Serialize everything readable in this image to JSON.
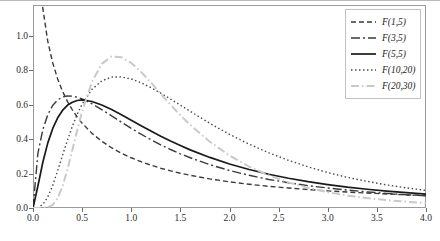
{
  "chart_data": {
    "type": "line",
    "title": "",
    "xlabel": "",
    "ylabel": "",
    "xlim": [
      0.0,
      4.0
    ],
    "ylim": [
      0.0,
      1.18
    ],
    "grid": false,
    "legend_position": "top-right",
    "xticks": [
      "0.0",
      "0.5",
      "1.0",
      "1.5",
      "2.0",
      "2.5",
      "3.0",
      "3.5",
      "4.0"
    ],
    "xtick_values": [
      0.0,
      0.5,
      1.0,
      1.5,
      2.0,
      2.5,
      3.0,
      3.5,
      4.0
    ],
    "yticks": [
      "0.0",
      "0.2",
      "0.4",
      "0.6",
      "0.8",
      "1.0"
    ],
    "ytick_values": [
      0.0,
      0.2,
      0.4,
      0.6,
      0.8,
      1.0
    ],
    "x": [
      0.0,
      0.05,
      0.1,
      0.15,
      0.2,
      0.25,
      0.3,
      0.35,
      0.4,
      0.45,
      0.5,
      0.6,
      0.7,
      0.8,
      0.9,
      1.0,
      1.1,
      1.2,
      1.3,
      1.4,
      1.5,
      1.6,
      1.8,
      2.0,
      2.2,
      2.4,
      2.6,
      2.8,
      3.0,
      3.2,
      3.4,
      3.6,
      3.8,
      4.0
    ],
    "series": [
      {
        "name": "F(1,5)",
        "label": "F(1,5)",
        "color": "#3a3a3a",
        "dash": "5,3",
        "width": 1.4,
        "values": [
          3.4,
          1.52,
          1.16,
          0.97,
          0.845,
          0.752,
          0.679,
          0.62,
          0.571,
          0.529,
          0.493,
          0.434,
          0.388,
          0.35,
          0.318,
          0.292,
          0.269,
          0.249,
          0.231,
          0.216,
          0.202,
          0.19,
          0.169,
          0.152,
          0.138,
          0.126,
          0.116,
          0.107,
          0.0995,
          0.0928,
          0.0869,
          0.0816,
          0.0769,
          0.0726
        ]
      },
      {
        "name": "F(3,5)",
        "label": "F(3,5)",
        "color": "#3a3a3a",
        "dash": "9,3,2,3",
        "width": 1.4,
        "values": [
          0.0,
          0.318,
          0.455,
          0.542,
          0.596,
          0.628,
          0.645,
          0.651,
          0.65,
          0.644,
          0.634,
          0.606,
          0.572,
          0.536,
          0.499,
          0.463,
          0.429,
          0.397,
          0.367,
          0.34,
          0.315,
          0.292,
          0.252,
          0.218,
          0.19,
          0.166,
          0.147,
          0.13,
          0.116,
          0.104,
          0.0937,
          0.0848,
          0.077,
          0.0703
        ]
      },
      {
        "name": "F(5,5)",
        "label": "F(5,5)",
        "color": "#1a1a1a",
        "dash": "",
        "width": 1.7,
        "values": [
          0.0,
          0.128,
          0.266,
          0.377,
          0.461,
          0.523,
          0.567,
          0.597,
          0.615,
          0.625,
          0.628,
          0.619,
          0.599,
          0.572,
          0.542,
          0.51,
          0.478,
          0.447,
          0.417,
          0.389,
          0.363,
          0.338,
          0.294,
          0.256,
          0.224,
          0.196,
          0.173,
          0.153,
          0.136,
          0.121,
          0.109,
          0.0983,
          0.0889,
          0.0807
        ]
      },
      {
        "name": "F(10,20)",
        "label": "F(10,20)",
        "color": "#4a4a4a",
        "dash": "1.5,2.5",
        "width": 1.4,
        "values": [
          0.0,
          0.0022,
          0.0205,
          0.0637,
          0.131,
          0.215,
          0.305,
          0.393,
          0.474,
          0.545,
          0.604,
          0.69,
          0.739,
          0.761,
          0.762,
          0.75,
          0.728,
          0.7,
          0.668,
          0.633,
          0.598,
          0.562,
          0.492,
          0.428,
          0.371,
          0.321,
          0.277,
          0.239,
          0.206,
          0.178,
          0.155,
          0.134,
          0.117,
          0.102
        ]
      },
      {
        "name": "F(20,30)",
        "label": "F(20,30)",
        "color": "#c9c9c9",
        "dash": "8,3,1.5,3",
        "width": 2.0,
        "values": [
          0.0,
          0.0,
          0.0002,
          0.0031,
          0.0176,
          0.056,
          0.125,
          0.222,
          0.336,
          0.452,
          0.561,
          0.733,
          0.838,
          0.881,
          0.877,
          0.843,
          0.791,
          0.729,
          0.664,
          0.6,
          0.539,
          0.483,
          0.385,
          0.305,
          0.241,
          0.19,
          0.149,
          0.117,
          0.0922,
          0.0727,
          0.0575,
          0.0456,
          0.0363,
          0.029
        ]
      }
    ],
    "legend_entries": [
      "F(1,5)",
      "F(3,5)",
      "F(5,5)",
      "F(10,20)",
      "F(20,30)"
    ]
  }
}
